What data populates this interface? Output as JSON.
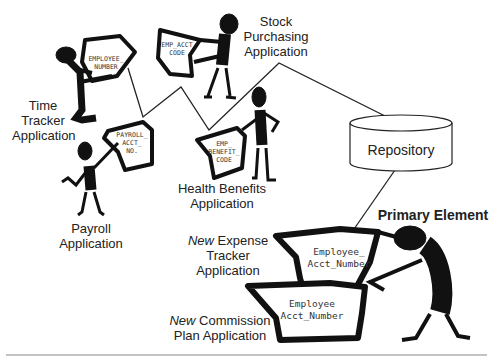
{
  "diagram": {
    "applications": [
      {
        "id": "time-tracker",
        "label_lines": [
          "Time",
          "Tracker",
          "Application"
        ],
        "element": [
          "EMPLOYEE_",
          "NUMBER"
        ]
      },
      {
        "id": "stock-purchasing",
        "label_lines": [
          "Stock",
          "Purchasing",
          "Application"
        ],
        "element": [
          "EMP_ACCT",
          "CODE"
        ]
      },
      {
        "id": "payroll",
        "label_lines": [
          "Payroll",
          "Application"
        ],
        "element": [
          "PAYROLL_",
          "ACCT_",
          "NO."
        ]
      },
      {
        "id": "health-benefits",
        "label_lines": [
          "Health Benefits",
          "Application"
        ],
        "element": [
          "EMP_",
          "BENEFIT_",
          "CODE"
        ]
      }
    ],
    "repository": {
      "label": "Repository"
    },
    "primary_element": {
      "label": "Primary Element"
    },
    "new_applications": [
      {
        "id": "expense-tracker",
        "prefix": "New",
        "label_line1": "Expense",
        "label_lines_rest": [
          "Tracker",
          "Application"
        ],
        "element": [
          "Employee_",
          "Acct_Number"
        ]
      },
      {
        "id": "commission-plan",
        "prefix": "New",
        "label_line1": "Commission",
        "label_lines_rest": [
          "Plan Application"
        ],
        "element": [
          "Employee",
          "Acct_Number"
        ]
      }
    ],
    "colors": {
      "ink": "#111111",
      "line": "#222222",
      "background": "#ffffff",
      "rule": "#888888"
    }
  }
}
